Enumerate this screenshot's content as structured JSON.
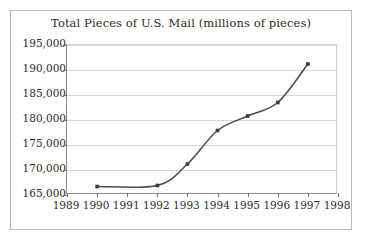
{
  "chart_data": {
    "type": "line",
    "title": "Total Pieces of U.S. Mail (millions of pieces)",
    "xlabel": "",
    "ylabel": "",
    "x": [
      1990,
      1992,
      1993,
      1994,
      1995,
      1996,
      1997
    ],
    "values": [
      166700,
      166900,
      171200,
      177900,
      180800,
      183500,
      191200
    ],
    "series": [
      {
        "name": "Total Pieces of U.S. Mail",
        "x": [
          1990,
          1992,
          1993,
          1994,
          1995,
          1996,
          1997
        ],
        "values": [
          166700,
          166900,
          171200,
          177900,
          180800,
          183500,
          191200
        ]
      }
    ],
    "xlim": [
      1989,
      1998
    ],
    "ylim": [
      165000,
      195000
    ],
    "xticks": [
      1989,
      1990,
      1991,
      1992,
      1993,
      1994,
      1995,
      1996,
      1997,
      1998
    ],
    "xtick_labels": [
      "1989",
      "1990",
      "1991",
      "1992",
      "1993",
      "1994",
      "1995",
      "1996",
      "1997",
      "1998"
    ],
    "yticks": [
      165000,
      170000,
      175000,
      180000,
      185000,
      190000,
      195000
    ],
    "ytick_labels": [
      "165,000",
      "170,000",
      "175,000",
      "180,000",
      "185,000",
      "190,000",
      "195,000"
    ],
    "grid": true,
    "grid_axis": "y",
    "legend": false,
    "markers": true,
    "marker_shape": "square",
    "line_color": "#4a4a4a",
    "marker_color": "#3a3a3a",
    "grid_color": "#d8d8d8",
    "axis_color": "#8a8a8a",
    "background_color": "#ffffff",
    "border_color": "#b9b9b9"
  }
}
